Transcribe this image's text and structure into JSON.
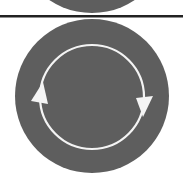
{
  "scene": {
    "description": "Cropped icon sheet: bottom of a previous round icon, a horizontal divider rule, and a round refresh/sync icon with two circular arrows",
    "icons": [
      {
        "name": "previous-round-icon-fragment",
        "kind": "partial-circle"
      },
      {
        "name": "refresh-icon",
        "kind": "circular-arrows",
        "arrow_directions": [
          "up-left",
          "down-right"
        ],
        "rotation": "clockwise"
      }
    ]
  },
  "colors": {
    "background": "#ffffff",
    "disc": "#5e5e5e",
    "ring": "#f4f4f4",
    "divider": "#222222"
  }
}
